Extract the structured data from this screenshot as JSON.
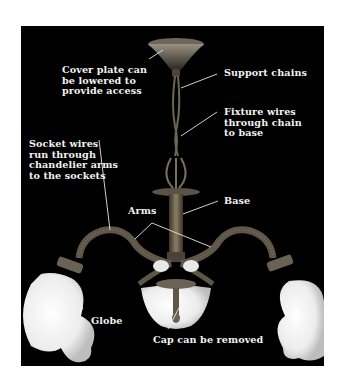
{
  "figure": {
    "subject": "chandelier",
    "background_color": "#000000",
    "label_color": "#f2f2f2",
    "labels": {
      "cover_plate": "Cover plate can\nbe lowered to\nprovide access",
      "support_chains": "Support chains",
      "fixture_wires": "Fixture wires\nthrough chain\nto base",
      "socket_wires": "Socket wires\nrun through\nchandelier arms\nto the sockets",
      "base": "Base",
      "arms": "Arms",
      "globe": "Globe",
      "cap": "Cap can be removed"
    }
  }
}
